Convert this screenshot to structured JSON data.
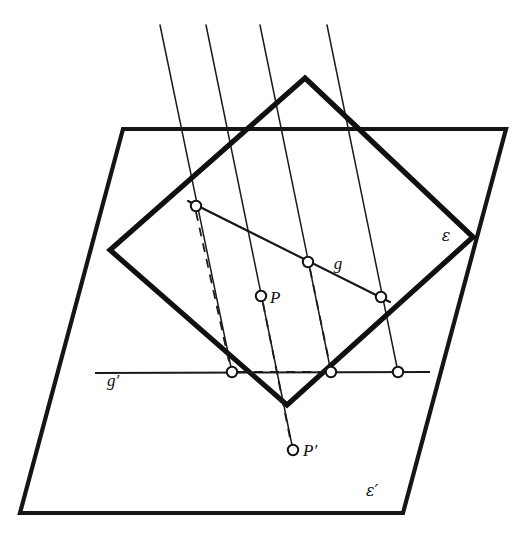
{
  "figure": {
    "background_color": "#ffffff",
    "ink_color": "#151515",
    "width": 527,
    "height": 536
  },
  "labels": {
    "epsilon": "ε",
    "epsilon_prime": "ε′",
    "line_g": "g",
    "line_g_prime": "g′",
    "point_p": "P",
    "point_p_prime": "P′"
  },
  "label_positions": {
    "epsilon": {
      "x": 446,
      "y": 241
    },
    "epsilon_prime": {
      "x": 372,
      "y": 496
    },
    "line_g": {
      "x": 338,
      "y": 269
    },
    "line_g_prime": {
      "x": 113,
      "y": 386
    },
    "point_p": {
      "x": 270,
      "y": 303
    },
    "point_p_prime": {
      "x": 303,
      "y": 456
    }
  },
  "shapes": {
    "image_plane_epsilon_prime": {
      "name": "epsilon-prime-plane",
      "kind": "parallelogram",
      "points": [
        [
          123,
          129
        ],
        [
          506,
          129
        ],
        [
          403,
          513
        ],
        [
          20,
          513
        ]
      ]
    },
    "object_plane_epsilon": {
      "name": "epsilon-plane",
      "kind": "tilted-rectangle",
      "points": [
        [
          305,
          78
        ],
        [
          473,
          237
        ],
        [
          287,
          405
        ],
        [
          110,
          250
        ]
      ]
    },
    "line_g": {
      "name": "line-g",
      "from": [
        188,
        201
      ],
      "to": [
        390,
        302
      ]
    },
    "line_g_prime": {
      "name": "line-g-prime",
      "from": [
        95,
        373
      ],
      "to": [
        430,
        372
      ]
    }
  },
  "projection_rays": [
    {
      "name": "ray-1",
      "from": [
        160,
        25
      ],
      "to": [
        232,
        372
      ]
    },
    {
      "name": "ray-2",
      "from": [
        206,
        25
      ],
      "to": [
        293,
        450
      ]
    },
    {
      "name": "ray-3",
      "from": [
        260,
        25
      ],
      "to": [
        331,
        372
      ]
    },
    {
      "name": "ray-4",
      "from": [
        327,
        25
      ],
      "to": [
        398,
        372
      ]
    }
  ],
  "dashed_connectors": [
    {
      "name": "dashed-g-start-to-image",
      "from": [
        196,
        212
      ],
      "to": [
        230,
        366
      ]
    },
    {
      "name": "dashed-p-to-p-prime",
      "from": [
        263,
        303
      ],
      "to": [
        291,
        443
      ]
    },
    {
      "name": "dashed-mid-to-image",
      "from": [
        310,
        269
      ],
      "to": [
        330,
        366
      ]
    },
    {
      "name": "dashed-g-prime-segment",
      "from": [
        238,
        372
      ],
      "to": [
        325,
        372
      ]
    }
  ],
  "nodes": [
    {
      "name": "node-g-start",
      "x": 196,
      "y": 206,
      "r": 5.2
    },
    {
      "name": "node-g-mid",
      "x": 308,
      "y": 262,
      "r": 5.2
    },
    {
      "name": "node-g-end",
      "x": 381,
      "y": 297,
      "r": 5.2
    },
    {
      "name": "node-point-p",
      "x": 261,
      "y": 296,
      "r": 5.2
    },
    {
      "name": "node-g-prime-1",
      "x": 232,
      "y": 372,
      "r": 5.2
    },
    {
      "name": "node-g-prime-2",
      "x": 331,
      "y": 372,
      "r": 5.2
    },
    {
      "name": "node-g-prime-3",
      "x": 398,
      "y": 372,
      "r": 5.2
    },
    {
      "name": "node-point-p-prime",
      "x": 293,
      "y": 450,
      "r": 5.2
    }
  ]
}
